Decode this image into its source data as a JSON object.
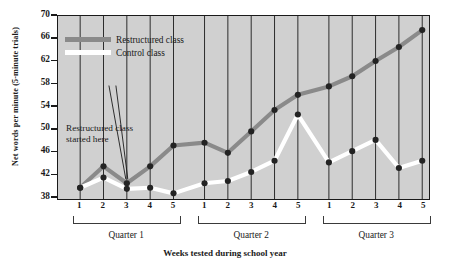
{
  "chart_data": {
    "type": "line",
    "title": "",
    "xlabel": "Weeks tested during school year",
    "ylabel": "Net words per minute (5-minute trials)",
    "ylim": [
      37.5,
      70
    ],
    "yticks": [
      38,
      42,
      46,
      50,
      54,
      58,
      62,
      66,
      70
    ],
    "grid": true,
    "legend_position": "upper-left-inside",
    "groups": [
      {
        "name": "Quarter 1",
        "weeks": [
          "1",
          "2",
          "3",
          "4",
          "5"
        ]
      },
      {
        "name": "Quarter 2",
        "weeks": [
          "1",
          "2",
          "3",
          "4",
          "5"
        ]
      },
      {
        "name": "Quarter 3",
        "weeks": [
          "1",
          "2",
          "3",
          "4",
          "5"
        ]
      }
    ],
    "x": [
      "1",
      "2",
      "3",
      "4",
      "5",
      "1",
      "2",
      "3",
      "4",
      "5",
      "1",
      "2",
      "3",
      "4",
      "5"
    ],
    "series": [
      {
        "name": "Restructured class",
        "color": "#8a8a8a",
        "values": [
          39.5,
          43.3,
          40.3,
          43.3,
          47.0,
          47.5,
          45.7,
          49.5,
          53.3,
          56.0,
          57.5,
          59.3,
          62.0,
          64.5,
          67.5
        ]
      },
      {
        "name": "Control class",
        "color": "#ffffff",
        "values": [
          39.5,
          41.3,
          39.3,
          39.5,
          38.5,
          40.3,
          40.7,
          42.3,
          44.3,
          52.5,
          44.0,
          46.0,
          48.0,
          43.0,
          44.3
        ]
      }
    ],
    "annotations": [
      {
        "text": "Restructured class started here",
        "line1": "Restructured class",
        "line2": "started here",
        "points_to_x_index": 2
      }
    ]
  },
  "legend": {
    "items": [
      {
        "label": "Restructured class"
      },
      {
        "label": "Control class"
      }
    ]
  },
  "axes": {
    "y_title": "Net words per minute (5-minute trials)",
    "x_title": "Weeks tested during school year"
  }
}
